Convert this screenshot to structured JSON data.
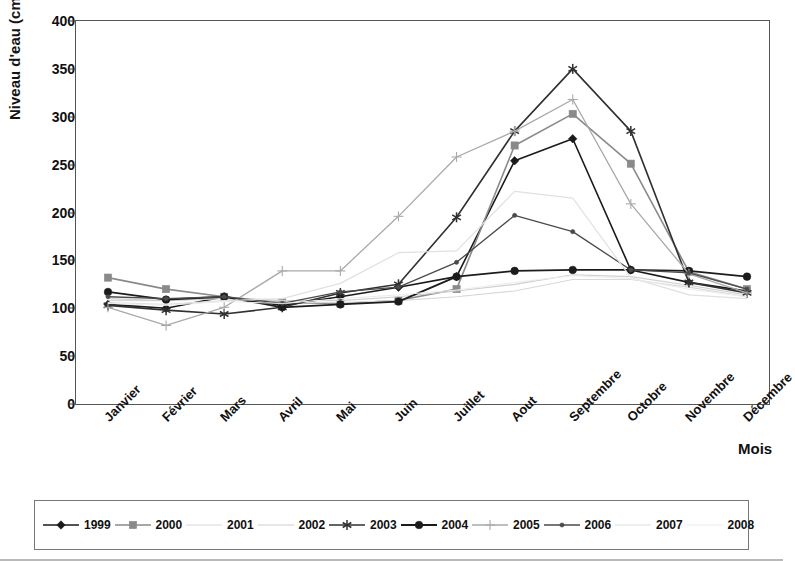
{
  "chart_data": {
    "type": "line",
    "title": "",
    "xlabel": "Mois",
    "ylabel": "Niveau d'eau (cm)",
    "ylim": [
      0,
      400
    ],
    "yticks": [
      0,
      50,
      100,
      150,
      200,
      250,
      300,
      350,
      400
    ],
    "grid": false,
    "legend_position": "bottom",
    "categories": [
      "Janvier",
      "Février",
      "Mars",
      "Avril",
      "Mai",
      "Juin",
      "Juillet",
      "Aout",
      "Septembre",
      "Octobre",
      "Novembre",
      "Décembre"
    ],
    "series": [
      {
        "name": "1999",
        "marker": "diamond",
        "color": "#1a1a1a",
        "width": 1.6,
        "values": [
          104,
          100,
          112,
          103,
          112,
          122,
          133,
          254,
          277,
          140,
          127,
          118
        ]
      },
      {
        "name": "2000",
        "marker": "square",
        "color": "#8a8a8a",
        "width": 1.6,
        "values": [
          132,
          120,
          112,
          106,
          105,
          108,
          120,
          270,
          303,
          251,
          138,
          120
        ]
      },
      {
        "name": "2001",
        "marker": "none",
        "color": "#d8d8d8",
        "width": 1.2,
        "values": [
          108,
          108,
          110,
          106,
          106,
          108,
          112,
          118,
          130,
          130,
          122,
          112
        ]
      },
      {
        "name": "2002",
        "marker": "none",
        "color": "#cfcfcf",
        "width": 1.2,
        "values": [
          110,
          108,
          111,
          108,
          108,
          112,
          118,
          125,
          135,
          133,
          124,
          114
        ]
      },
      {
        "name": "2003",
        "marker": "asterisk",
        "color": "#303030",
        "width": 1.6,
        "values": [
          103,
          98,
          94,
          101,
          116,
          125,
          195,
          285,
          350,
          285,
          127,
          116
        ]
      },
      {
        "name": "2004",
        "marker": "circle",
        "color": "#1c1c1c",
        "width": 1.8,
        "values": [
          117,
          109,
          112,
          101,
          104,
          107,
          133,
          139,
          140,
          140,
          139,
          133
        ]
      },
      {
        "name": "2005",
        "marker": "plus",
        "color": "#a9a9a9",
        "width": 1.3,
        "values": [
          101,
          82,
          101,
          139,
          139,
          196,
          258,
          285,
          318,
          209,
          136,
          116
        ]
      },
      {
        "name": "2006",
        "marker": "dot",
        "color": "#4a4a4a",
        "width": 1.3,
        "values": [
          112,
          110,
          112,
          105,
          117,
          122,
          148,
          197,
          180,
          140,
          137,
          120
        ]
      },
      {
        "name": "2007",
        "marker": "none",
        "color": "#e0e0e0",
        "width": 1.2,
        "values": [
          106,
          104,
          108,
          110,
          126,
          158,
          160,
          222,
          215,
          132,
          114,
          110
        ]
      },
      {
        "name": "2008",
        "marker": "none",
        "color": "#ececec",
        "width": 1.0,
        "values": [
          105,
          103,
          107,
          105,
          110,
          114,
          119,
          127,
          134,
          131,
          120,
          112
        ]
      }
    ]
  },
  "legend": {
    "items": [
      {
        "label": "1999"
      },
      {
        "label": "2000"
      },
      {
        "label": "2001"
      },
      {
        "label": "2002"
      },
      {
        "label": "2003"
      },
      {
        "label": "2004"
      },
      {
        "label": "2005"
      },
      {
        "label": "2006"
      },
      {
        "label": "2007"
      },
      {
        "label": "2008"
      }
    ]
  }
}
